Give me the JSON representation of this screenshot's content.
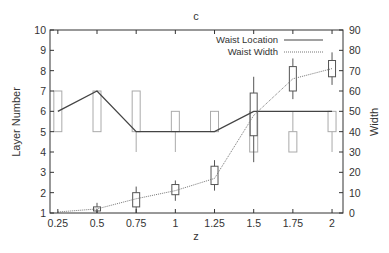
{
  "chart_data": {
    "type": "line",
    "title": "c",
    "xlabel": "z",
    "ylabel": "Layer Number",
    "y2label": "Width",
    "x": [
      0.25,
      0.5,
      0.75,
      1,
      1.25,
      1.5,
      1.75,
      2
    ],
    "x_tick_labels": [
      "0.25",
      "0.5",
      "0.75",
      "1",
      "1.25",
      "1.5",
      "1.75",
      "2"
    ],
    "xlim": [
      0.2,
      2.07
    ],
    "ylim": [
      1,
      10
    ],
    "y_ticks": [
      1,
      2,
      3,
      4,
      5,
      6,
      7,
      8,
      9,
      10
    ],
    "y2lim": [
      0,
      90
    ],
    "y2_ticks": [
      0,
      10,
      20,
      30,
      40,
      50,
      60,
      70,
      80,
      90
    ],
    "grid": false,
    "legend_position": "upper center",
    "series": [
      {
        "name": "Waist Location",
        "axis": "left",
        "style": "solid",
        "color": "#444444",
        "values": [
          6,
          7,
          5,
          5,
          5,
          6,
          6,
          6
        ],
        "boxes": [
          {
            "q1": 5,
            "q3": 7,
            "wlo": 5,
            "whi": 7
          },
          {
            "q1": 5,
            "q3": 7,
            "wlo": 5,
            "whi": 7
          },
          {
            "q1": 5,
            "q3": 7,
            "wlo": 4,
            "whi": 7
          },
          {
            "q1": 5,
            "q3": 6,
            "wlo": 4,
            "whi": 6
          },
          {
            "q1": 5,
            "q3": 6,
            "wlo": 5,
            "whi": 6
          },
          {
            "q1": 4,
            "q3": 6,
            "wlo": 4,
            "whi": 6
          },
          {
            "q1": 4,
            "q3": 5,
            "wlo": 4,
            "whi": 6
          },
          {
            "q1": 5,
            "q3": 6,
            "wlo": 4,
            "whi": 6
          }
        ]
      },
      {
        "name": "Waist Width",
        "axis": "right",
        "style": "dotted",
        "color": "#777777",
        "values": [
          0.5,
          2,
          7,
          11,
          17,
          48,
          66,
          71
        ],
        "boxes": [
          null,
          {
            "q1": 1,
            "q3": 3,
            "wlo": 0,
            "whi": 5
          },
          {
            "q1": 3,
            "q3": 10,
            "wlo": 0,
            "whi": 13
          },
          {
            "q1": 9,
            "q3": 14,
            "wlo": 6,
            "whi": 16
          },
          {
            "q1": 14,
            "q3": 23,
            "wlo": 11,
            "whi": 26
          },
          {
            "q1": 38,
            "q3": 59,
            "wlo": 25,
            "whi": 67
          },
          {
            "q1": 60,
            "q3": 72,
            "wlo": 56,
            "whi": 76
          },
          {
            "q1": 67,
            "q3": 75,
            "wlo": 63,
            "whi": 79
          }
        ]
      }
    ]
  }
}
